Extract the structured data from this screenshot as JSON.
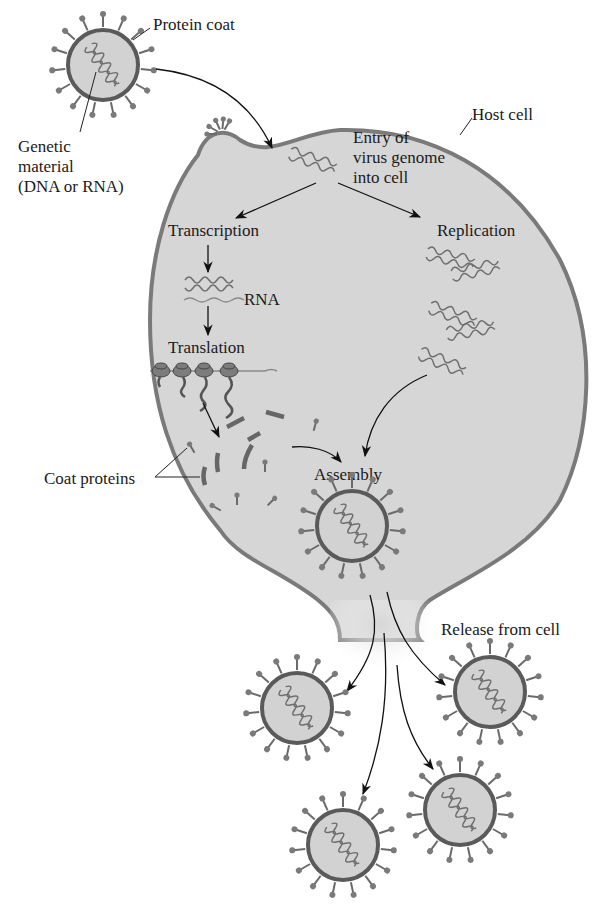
{
  "figure": {
    "labels": {
      "protein_coat": "Protein coat",
      "genetic_material_line1": "Genetic",
      "genetic_material_line2": "material",
      "genetic_material_line3": "(DNA or RNA)",
      "host_cell": "Host cell",
      "entry_line1": "Entry of",
      "entry_line2": "virus genome",
      "entry_line3": "into cell",
      "transcription": "Transcription",
      "rna": "RNA",
      "translation": "Translation",
      "replication": "Replication",
      "coat_proteins": "Coat proteins",
      "assembly": "Assembly",
      "release": "Release from cell"
    },
    "stages": [
      "Entry of virus genome into cell",
      "Transcription",
      "Translation",
      "Replication",
      "Assembly",
      "Release from cell"
    ],
    "released_virions": 4,
    "colors": {
      "cell_fill": "#d6d6d6",
      "cell_outline": "#7a7a7a",
      "capsid_outline": "#5a5a5a",
      "text": "#1a1a1a"
    }
  }
}
